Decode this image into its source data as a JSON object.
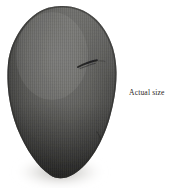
{
  "page": {
    "background_color": "#ffffff",
    "width": 179,
    "height": 188
  },
  "figure": {
    "subject_name": "dark-ovoid-stone",
    "subject_description": "Large dark gray ovoid stone specimen, broad rounded top tapering to a narrow rounded base",
    "colors": {
      "body_light": "#6e6e6c",
      "body_mid": "#565654",
      "body_dark": "#3a3a38",
      "body_edge": "#2c2c2a",
      "rim_highlight": "#8a8a87",
      "shadow": "#b9b7b3",
      "background": "#ffffff"
    },
    "marks": [
      {
        "name": "diagonal-crack-mark",
        "description": "thin dark diagonal fissure on the upper right face"
      },
      {
        "name": "lower-right-blemish",
        "description": "small faint dark blemish near the lower right edge"
      }
    ],
    "texture": "fine vertical halftone striations"
  },
  "caption": {
    "text": "Actual size",
    "color": "#2a2724"
  }
}
